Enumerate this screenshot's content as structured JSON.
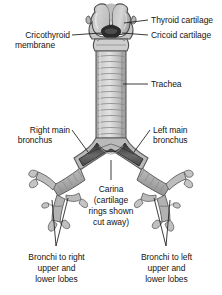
{
  "figure": {
    "background_color": "#ffffff",
    "line_color": "#1a1a1a",
    "palette": {
      "cartilage_light": "#d9d9d9",
      "cartilage_mid": "#b3b3b3",
      "cartilage_dark": "#8a8a8a",
      "lumen_dark": "#3a3a3a",
      "lumen_darkest": "#222222",
      "outline": "#4a4a4a"
    }
  },
  "labels": {
    "thyroid_cartilage": "Thyroid cartilage",
    "cricoid_cartilage": "Cricoid cartilage",
    "cricothyroid_membrane_line1": "Cricothyroid",
    "cricothyroid_membrane_line2": "membrane",
    "trachea": "Trachea",
    "right_main_bronchus_line1": "Right main",
    "right_main_bronchus_line2": "bronchus",
    "left_main_bronchus_line1": "Left main",
    "left_main_bronchus_line2": "bronchus",
    "carina_line1": "Carina",
    "carina_line2": "(cartilage",
    "carina_line3": "rings shown",
    "carina_line4": "cut away)",
    "bronchi_right_line1": "Bronchi to right",
    "bronchi_right_line2": "upper and",
    "bronchi_right_line3": "lower lobes",
    "bronchi_left_line1": "Bronchi to left",
    "bronchi_left_line2": "upper and",
    "bronchi_left_line3": "lower lobes"
  },
  "structures": {
    "tracheal_ring_count": 14,
    "parts": [
      "thyroid cartilage",
      "cricoid cartilage",
      "cricothyroid membrane",
      "trachea",
      "carina",
      "right main bronchus",
      "left main bronchus",
      "lobar bronchi"
    ]
  }
}
